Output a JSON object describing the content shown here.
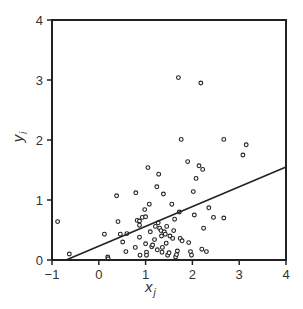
{
  "chart_data": {
    "type": "scatter",
    "title": "",
    "xlabel": "x_j",
    "ylabel": "y_i",
    "xlabel_main": "x",
    "xlabel_sub": "j",
    "ylabel_main": "y",
    "ylabel_sub": "i",
    "xlim": [
      -1,
      4
    ],
    "ylim": [
      0,
      4
    ],
    "xticks": [
      -1,
      0,
      1,
      2,
      3,
      4
    ],
    "yticks": [
      0,
      1,
      2,
      3,
      4
    ],
    "xtick_labels": [
      "−1",
      "0",
      "1",
      "2",
      "3",
      "4"
    ],
    "ytick_labels": [
      "0",
      "1",
      "2",
      "3",
      "4"
    ],
    "grid": false,
    "legend": null,
    "regression_line": {
      "x0": -0.7,
      "y0": 0.0,
      "x1": 4.0,
      "y1": 1.55
    },
    "points": [
      {
        "x": -0.88,
        "y": 0.64
      },
      {
        "x": -0.63,
        "y": 0.1
      },
      {
        "x": 0.19,
        "y": 0.05
      },
      {
        "x": 0.2,
        "y": 0.02
      },
      {
        "x": 0.12,
        "y": 0.43
      },
      {
        "x": 0.38,
        "y": 1.07
      },
      {
        "x": 0.41,
        "y": 0.64
      },
      {
        "x": 0.46,
        "y": 0.43
      },
      {
        "x": 0.51,
        "y": 0.3
      },
      {
        "x": 0.58,
        "y": 0.14
      },
      {
        "x": 0.6,
        "y": 0.44
      },
      {
        "x": 0.78,
        "y": 0.21
      },
      {
        "x": 0.79,
        "y": 1.12
      },
      {
        "x": 0.82,
        "y": 0.66
      },
      {
        "x": 0.87,
        "y": 0.65
      },
      {
        "x": 0.87,
        "y": 0.58
      },
      {
        "x": 0.87,
        "y": 0.38
      },
      {
        "x": 0.88,
        "y": 0.08
      },
      {
        "x": 0.93,
        "y": 0.71
      },
      {
        "x": 0.98,
        "y": 0.84
      },
      {
        "x": 1.0,
        "y": 0.27
      },
      {
        "x": 1.0,
        "y": 0.72
      },
      {
        "x": 1.02,
        "y": 0.13
      },
      {
        "x": 1.02,
        "y": 0.08
      },
      {
        "x": 1.05,
        "y": 1.54
      },
      {
        "x": 1.08,
        "y": 0.93
      },
      {
        "x": 1.1,
        "y": 0.47
      },
      {
        "x": 1.13,
        "y": 0.22
      },
      {
        "x": 1.15,
        "y": 0.25
      },
      {
        "x": 1.19,
        "y": 0.34
      },
      {
        "x": 1.21,
        "y": 0.56
      },
      {
        "x": 1.24,
        "y": 1.22
      },
      {
        "x": 1.25,
        "y": 0.17
      },
      {
        "x": 1.27,
        "y": 0.62
      },
      {
        "x": 1.28,
        "y": 1.43
      },
      {
        "x": 1.3,
        "y": 0.53
      },
      {
        "x": 1.33,
        "y": 0.49
      },
      {
        "x": 1.34,
        "y": 0.4
      },
      {
        "x": 1.35,
        "y": 0.13
      },
      {
        "x": 1.36,
        "y": 0.21
      },
      {
        "x": 1.38,
        "y": 1.1
      },
      {
        "x": 1.4,
        "y": 0.47
      },
      {
        "x": 1.42,
        "y": 0.43
      },
      {
        "x": 1.44,
        "y": 0.28
      },
      {
        "x": 1.45,
        "y": 0.56
      },
      {
        "x": 1.47,
        "y": 0.08
      },
      {
        "x": 1.5,
        "y": 0.12
      },
      {
        "x": 1.52,
        "y": 0.4
      },
      {
        "x": 1.56,
        "y": 0.93
      },
      {
        "x": 1.58,
        "y": 0.36
      },
      {
        "x": 1.6,
        "y": 0.49
      },
      {
        "x": 1.62,
        "y": 0.68
      },
      {
        "x": 1.64,
        "y": 0.05
      },
      {
        "x": 1.66,
        "y": 0.09
      },
      {
        "x": 1.68,
        "y": 0.15
      },
      {
        "x": 1.7,
        "y": 3.04
      },
      {
        "x": 1.72,
        "y": 0.8
      },
      {
        "x": 1.74,
        "y": 0.36
      },
      {
        "x": 1.76,
        "y": 2.01
      },
      {
        "x": 1.78,
        "y": 0.32
      },
      {
        "x": 1.9,
        "y": 1.64
      },
      {
        "x": 1.92,
        "y": 0.29
      },
      {
        "x": 1.96,
        "y": 0.14
      },
      {
        "x": 1.98,
        "y": 0.08
      },
      {
        "x": 2.02,
        "y": 1.14
      },
      {
        "x": 2.04,
        "y": 0.75
      },
      {
        "x": 2.08,
        "y": 1.36
      },
      {
        "x": 2.14,
        "y": 1.57
      },
      {
        "x": 2.18,
        "y": 2.95
      },
      {
        "x": 2.2,
        "y": 0.18
      },
      {
        "x": 2.22,
        "y": 1.51
      },
      {
        "x": 2.24,
        "y": 0.53
      },
      {
        "x": 2.3,
        "y": 0.14
      },
      {
        "x": 2.35,
        "y": 0.87
      },
      {
        "x": 2.45,
        "y": 0.71
      },
      {
        "x": 2.67,
        "y": 2.01
      },
      {
        "x": 2.67,
        "y": 0.7
      },
      {
        "x": 3.08,
        "y": 1.75
      },
      {
        "x": 3.15,
        "y": 1.92
      }
    ]
  }
}
